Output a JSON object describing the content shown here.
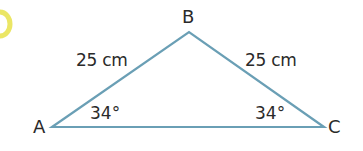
{
  "diagram": {
    "type": "isosceles-triangle",
    "colors": {
      "stroke": "#6a9fb5",
      "text": "#2a2a2a",
      "accent_marker": "#e8e24a"
    },
    "vertices": {
      "A": {
        "label": "A",
        "x": 52,
        "y": 127
      },
      "B": {
        "label": "B",
        "x": 189,
        "y": 32
      },
      "C": {
        "label": "C",
        "x": 324,
        "y": 127
      }
    },
    "sides": {
      "AB": {
        "label": "25 cm"
      },
      "BC": {
        "label": "25 cm"
      }
    },
    "angles": {
      "A": {
        "label": "34°"
      },
      "C": {
        "label": "34°"
      }
    }
  }
}
